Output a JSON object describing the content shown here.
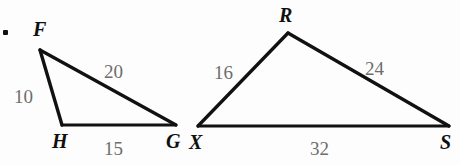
{
  "figure": {
    "background_color": "#fdfdfd",
    "stroke_color": "#111111",
    "vertex_label_color": "#101010",
    "side_label_color": "#6d6d6d",
    "bullet": {
      "name": "list-bullet",
      "x": 5,
      "y": 32,
      "r": 3
    },
    "triangles": [
      {
        "id": "triangle-FHG",
        "name": "Triangle FHG",
        "vertices": [
          {
            "label": "F",
            "x": 40,
            "y": 50,
            "label_x": 33,
            "label_y": 36
          },
          {
            "label": "H",
            "x": 62,
            "y": 125,
            "label_x": 52,
            "label_y": 148
          },
          {
            "label": "G",
            "x": 176,
            "y": 125,
            "label_x": 166,
            "label_y": 148
          }
        ],
        "sides": [
          {
            "label": "10",
            "from": "F",
            "to": "H",
            "label_x": 14,
            "label_y": 103
          },
          {
            "label": "20",
            "from": "F",
            "to": "G",
            "label_x": 104,
            "label_y": 78
          },
          {
            "label": "15",
            "from": "H",
            "to": "G",
            "label_x": 104,
            "label_y": 155
          }
        ]
      },
      {
        "id": "triangle-RXS",
        "name": "Triangle RXS",
        "vertices": [
          {
            "label": "R",
            "x": 288,
            "y": 33,
            "label_x": 279,
            "label_y": 22
          },
          {
            "label": "X",
            "x": 198,
            "y": 126,
            "label_x": 189,
            "label_y": 149
          },
          {
            "label": "S",
            "x": 449,
            "y": 126,
            "label_x": 440,
            "label_y": 149
          }
        ],
        "sides": [
          {
            "label": "16",
            "from": "X",
            "to": "R",
            "label_x": 214,
            "label_y": 79
          },
          {
            "label": "24",
            "from": "R",
            "to": "S",
            "label_x": 365,
            "label_y": 75
          },
          {
            "label": "32",
            "from": "X",
            "to": "S",
            "label_x": 310,
            "label_y": 155
          }
        ]
      }
    ]
  }
}
